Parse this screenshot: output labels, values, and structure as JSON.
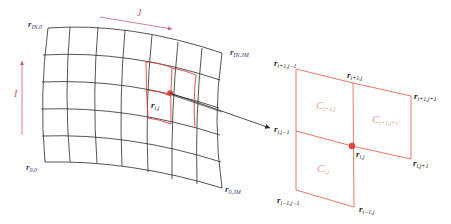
{
  "left_grid": {
    "axis_j": {
      "label": "J",
      "color": "#c8607a"
    },
    "axis_i": {
      "label": "I",
      "color": "#c8607a"
    },
    "corners": {
      "top_left": {
        "r": "r",
        "sub": "IN,0"
      },
      "top_right": {
        "r": "r",
        "sub": "IN,JM"
      },
      "bottom_left": {
        "r": "r",
        "sub": "0,0"
      },
      "bottom_right": {
        "r": "r",
        "sub": "0,JM"
      }
    },
    "point": {
      "r": "r",
      "sub": "i,j"
    },
    "grid_color": "#2a2a2a",
    "highlight_color": "#e0443a"
  },
  "right_stencil": {
    "points": {
      "p_ip1_jm1": {
        "r": "r",
        "sub": "i+1,j−1"
      },
      "p_ip1_j": {
        "r": "r",
        "sub": "i+1,j"
      },
      "p_ip1_jp1": {
        "r": "r",
        "sub": "i+1,j+1"
      },
      "p_i_jm1": {
        "r": "r",
        "sub": "i,j−1"
      },
      "p_i_j": {
        "r": "r",
        "sub": "i,j"
      },
      "p_i_jp1": {
        "r": "r",
        "sub": "i,j+1"
      },
      "p_im1_jm1": {
        "r": "r",
        "sub": "i−1,j−1"
      },
      "p_im1_j": {
        "r": "r",
        "sub": "i−1,j"
      }
    },
    "cells": {
      "c_ip1_j": {
        "c": "C",
        "sub": "i+1,j"
      },
      "c_ip1_jp1": {
        "c": "C",
        "sub": "i+1,j+1"
      },
      "c_i_j": {
        "c": "C",
        "sub": "i,j"
      }
    },
    "line_color": "#e86a5a",
    "cell_label_color": "#e8a090"
  }
}
